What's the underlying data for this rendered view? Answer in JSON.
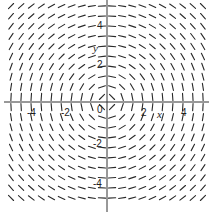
{
  "chart_data": {
    "type": "slope_field",
    "title": "",
    "equation": "dy/dx = -x/y",
    "xlabel": "x",
    "ylabel": "y",
    "xlim": [
      -5.5,
      5.3
    ],
    "ylim": [
      -5.5,
      5.5
    ],
    "grid": false,
    "x_ticks": [
      -4,
      -2,
      0,
      2,
      4
    ],
    "y_ticks": [
      4,
      2,
      -2,
      -4
    ],
    "tick_labels": {
      "x": [
        "-4",
        "-2",
        "0",
        "2",
        "4"
      ],
      "y": [
        "4",
        "2",
        "-2",
        "-4"
      ]
    },
    "field_grid": {
      "columns": 20,
      "rows": 20,
      "spacing_units": 0.52
    },
    "colors": {
      "segments": "#2a2a2a",
      "axes": "#333333",
      "background": "#ffffff"
    }
  },
  "labels": {
    "x_axis": "x",
    "y_axis": "y",
    "origin": "0",
    "x_neg4": "-4",
    "x_neg2": "-2",
    "x_pos2": "2",
    "x_pos4": "4",
    "y_pos4": "4",
    "y_pos2": "2",
    "y_neg2": "-2",
    "y_neg4": "-4"
  }
}
